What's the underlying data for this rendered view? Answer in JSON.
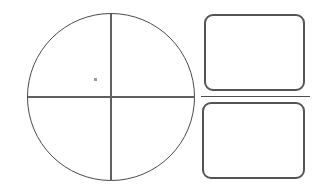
{
  "colors": {
    "background": "#ffffff",
    "circle-stroke": "#4a4a4a",
    "crosshair-stroke": "#606060",
    "rect-stroke": "#545454",
    "separator-stroke": "#4f4f4f",
    "dot": "#9b9b9b"
  },
  "shapes": {
    "circle": "circle-outline-with-crosshair-quadrants",
    "mark": "small-stray-dot",
    "rect_top": "rounded-rectangle",
    "rect_bottom": "rounded-rectangle",
    "separator": "thin-horizontal-rule"
  }
}
